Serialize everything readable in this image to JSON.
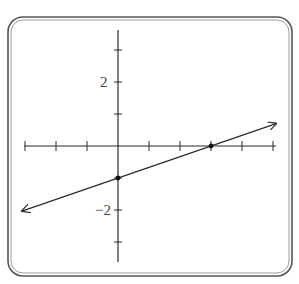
{
  "chart_data": {
    "type": "line",
    "title": "",
    "xlabel": "",
    "ylabel": "",
    "xlim": [
      -3,
      5
    ],
    "ylim": [
      -3.6,
      3.6
    ],
    "grid": false,
    "legend": null,
    "x_ticks": [
      -3,
      -2,
      -1,
      0,
      1,
      2,
      3,
      4,
      5
    ],
    "y_ticks": [
      -3,
      -2,
      -1,
      1,
      2,
      3
    ],
    "y_tick_labels": [
      {
        "value": 2,
        "label": "2"
      },
      {
        "value": -2,
        "label": "−2"
      }
    ],
    "series": [
      {
        "name": "line",
        "equation": "y = x/3 - 1",
        "x": [
          -3,
          5
        ],
        "y": [
          -2,
          0.667
        ],
        "arrows": "both"
      }
    ],
    "points": [
      {
        "x": 0,
        "y": -1,
        "label": "y-intercept"
      },
      {
        "x": 3,
        "y": 0,
        "label": "x-intercept"
      }
    ]
  },
  "labels": {
    "y_pos_2": "2",
    "y_neg_2": "−2"
  }
}
